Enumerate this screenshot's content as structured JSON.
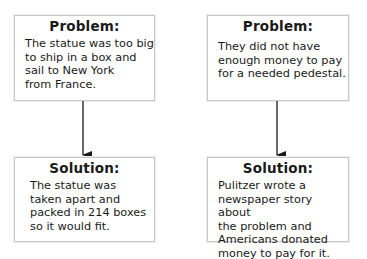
{
  "columns": [
    {
      "problem": {
        "title": "Problem:",
        "text": "The statue was too big\nto ship in a box and\nsail to New York\nfrom France."
      },
      "solution": {
        "title": "Solution:",
        "text": "The statue was\ntaken apart and\npacked in 214 boxes\nso it would fit."
      }
    },
    {
      "problem": {
        "title": "Problem:",
        "text": "They did not have\nenough money to pay\nfor a needed pedestal."
      },
      "solution": {
        "title": "Solution:",
        "text": "Pulitzer wrote a\nnewspaper story about\nthe problem and\nAmericans donated\nmoney to pay for it."
      }
    }
  ],
  "colors": {
    "box_border": "#c8c8c8",
    "arrow": "#1a1a1a",
    "text": "#1a1a1a"
  }
}
